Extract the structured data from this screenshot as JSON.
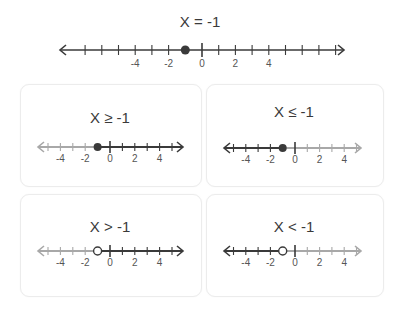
{
  "colors": {
    "active": "#3a3a3a",
    "inactive": "#a8a8a8",
    "text": "#3a3a3a",
    "card_border": "#ececec"
  },
  "main": {
    "title": "X = -1",
    "point": -1,
    "point_style": "closed",
    "shade": "none",
    "tick_range": [
      -7,
      8
    ],
    "labels": [
      "-4",
      "-2",
      "0",
      "2",
      "4"
    ]
  },
  "cards": [
    {
      "title": "X ≥ -1",
      "point": -1,
      "point_style": "closed",
      "shade": "right",
      "tick_range": [
        -5,
        5
      ],
      "labels": [
        "-4",
        "-2",
        "0",
        "2",
        "4"
      ]
    },
    {
      "title": "X ≤ -1",
      "point": -1,
      "point_style": "closed",
      "shade": "left",
      "tick_range": [
        -5,
        5
      ],
      "labels": [
        "-4",
        "-2",
        "0",
        "2",
        "4"
      ]
    },
    {
      "title": "X > -1",
      "point": -1,
      "point_style": "open",
      "shade": "right",
      "tick_range": [
        -5,
        5
      ],
      "labels": [
        "-4",
        "-2",
        "0",
        "2",
        "4"
      ]
    },
    {
      "title": "X < -1",
      "point": -1,
      "point_style": "open",
      "shade": "left",
      "tick_range": [
        -5,
        5
      ],
      "labels": [
        "-4",
        "-2",
        "0",
        "2",
        "4"
      ]
    }
  ]
}
